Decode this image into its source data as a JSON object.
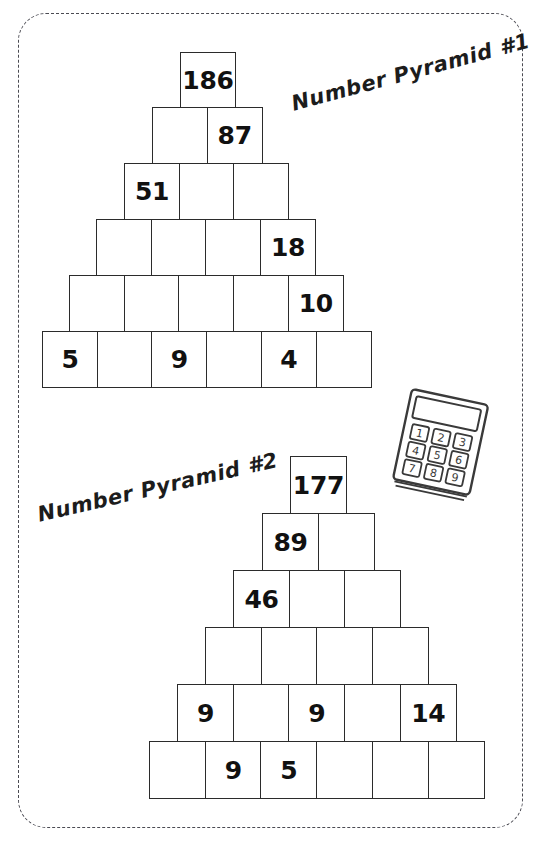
{
  "page": {
    "background_color": "#ffffff",
    "frame_color": "#4a4a52",
    "ink_color": "#1c1c1c"
  },
  "pyramids": [
    {
      "id": "pyramid-1",
      "title": "Number Pyramid #1",
      "rows": [
        {
          "index": 1,
          "cells": [
            "186"
          ]
        },
        {
          "index": 2,
          "cells": [
            "",
            "87"
          ]
        },
        {
          "index": 3,
          "cells": [
            "51",
            "",
            ""
          ]
        },
        {
          "index": 4,
          "cells": [
            "",
            "",
            "",
            "18"
          ]
        },
        {
          "index": 5,
          "cells": [
            "",
            "",
            "",
            "",
            "10"
          ]
        },
        {
          "index": 6,
          "cells": [
            "5",
            "",
            "9",
            "",
            "4",
            ""
          ]
        }
      ]
    },
    {
      "id": "pyramid-2",
      "title": "Number Pyramid #2",
      "rows": [
        {
          "index": 1,
          "cells": [
            "177"
          ]
        },
        {
          "index": 2,
          "cells": [
            "89",
            ""
          ]
        },
        {
          "index": 3,
          "cells": [
            "46",
            "",
            ""
          ]
        },
        {
          "index": 4,
          "cells": [
            "",
            "",
            "",
            ""
          ]
        },
        {
          "index": 5,
          "cells": [
            "9",
            "",
            "9",
            "",
            "14"
          ]
        },
        {
          "index": 6,
          "cells": [
            "",
            "9",
            "5",
            "",
            "",
            ""
          ]
        }
      ]
    }
  ],
  "calculator": {
    "name": "calculator-doodle",
    "keys": [
      "1",
      "2",
      "3",
      "4",
      "5",
      "6",
      "7",
      "8",
      "9"
    ]
  }
}
